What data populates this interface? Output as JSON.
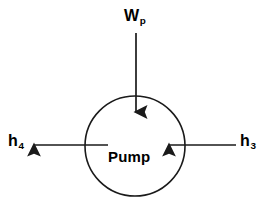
{
  "diagram": {
    "background_color": "#ffffff",
    "stroke_color": "#000000",
    "component": {
      "shape": "circle",
      "label": "Pump",
      "center_x": 135,
      "center_y": 146,
      "radius": 50
    },
    "flows": [
      {
        "id": "work-input",
        "symbol": "W",
        "subscript": "p",
        "label": "W",
        "direction": "down",
        "role": "work-input",
        "from_x": 136,
        "from_y": 33,
        "to_x": 136,
        "to_y": 112
      },
      {
        "id": "enthalpy-outlet",
        "symbol": "h",
        "subscript": "4",
        "label": "h",
        "direction": "left",
        "role": "outlet",
        "from_x": 108,
        "from_y": 145,
        "to_x": 33,
        "to_y": 145
      },
      {
        "id": "enthalpy-inlet",
        "symbol": "h",
        "subscript": "3",
        "label": "h",
        "direction": "left",
        "role": "inlet",
        "from_x": 236,
        "from_y": 145,
        "to_x": 168,
        "to_y": 145
      }
    ]
  }
}
